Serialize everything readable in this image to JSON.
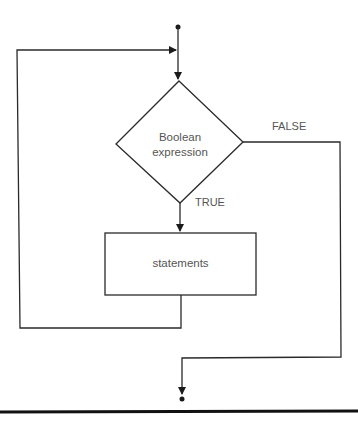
{
  "diagram": {
    "type": "flowchart",
    "decision": {
      "label_line1": "Boolean",
      "label_line2": "expression"
    },
    "process": {
      "label": "statements"
    },
    "branches": {
      "true_label": "TRUE",
      "false_label": "FALSE"
    },
    "colors": {
      "line": "#2a2a2a",
      "text": "#555555",
      "background": "#ffffff"
    }
  }
}
